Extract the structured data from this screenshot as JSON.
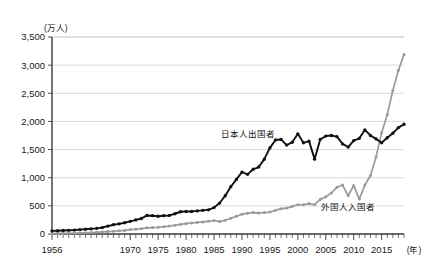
{
  "chart_data": {
    "type": "line",
    "title": "",
    "xlabel": "(年)",
    "ylabel": "(万人)",
    "ylim": [
      0,
      3500
    ],
    "xlim": [
      1956,
      2019
    ],
    "grid": true,
    "legend_position": "inline-annotation",
    "ytick_labels": [
      "0",
      "500",
      "1,000",
      "1,500",
      "2,000",
      "2,500",
      "3,000",
      "3,500"
    ],
    "ytick_values": [
      0,
      500,
      1000,
      1500,
      2000,
      2500,
      3000,
      3500
    ],
    "xtick_labels": [
      "1956",
      "1970",
      "1975",
      "1980",
      "1985",
      "1990",
      "1995",
      "2000",
      "2005",
      "2010",
      "2015"
    ],
    "xtick_values": [
      1956,
      1970,
      1975,
      1980,
      1985,
      1990,
      1995,
      2000,
      2005,
      2010,
      2015
    ],
    "x": [
      1956,
      1957,
      1958,
      1959,
      1960,
      1961,
      1962,
      1963,
      1964,
      1965,
      1966,
      1967,
      1968,
      1969,
      1970,
      1971,
      1972,
      1973,
      1974,
      1975,
      1976,
      1977,
      1978,
      1979,
      1980,
      1981,
      1982,
      1983,
      1984,
      1985,
      1986,
      1987,
      1988,
      1989,
      1990,
      1991,
      1992,
      1993,
      1994,
      1995,
      1996,
      1997,
      1998,
      1999,
      2000,
      2001,
      2002,
      2003,
      2004,
      2005,
      2006,
      2007,
      2008,
      2009,
      2010,
      2011,
      2012,
      2013,
      2014,
      2015,
      2016,
      2017,
      2018,
      2019
    ],
    "series": [
      {
        "name": "日本人出国者",
        "color": "#111111",
        "values": [
          55,
          58,
          62,
          66,
          70,
          76,
          82,
          90,
          100,
          120,
          145,
          160,
          175,
          200,
          230,
          250,
          280,
          330,
          350,
          350,
          365,
          380,
          400,
          420,
          440,
          450,
          445,
          450,
          460,
          470,
          475,
          480,
          490,
          500,
          520,
          540,
          560,
          570,
          590,
          610,
          640,
          680,
          700,
          730,
          760,
          790,
          830,
          860,
          880,
          900,
          910,
          920,
          930,
          940,
          950,
          960,
          970,
          980,
          990,
          1000,
          1010,
          1020,
          1030,
          1040
        ]
      },
      {
        "name": "外国人入国者",
        "color": "#9a9a9a",
        "values": [
          10,
          12,
          14,
          16,
          18,
          20,
          23,
          26,
          30,
          35,
          40,
          45,
          50,
          56,
          62,
          70,
          80,
          90,
          100,
          110,
          120,
          130,
          140,
          150,
          160,
          170,
          180,
          190,
          200,
          210,
          220,
          230,
          245,
          260,
          275,
          290,
          305,
          320,
          335,
          350,
          365,
          380,
          395,
          410,
          425,
          440,
          455,
          470,
          485,
          500,
          515,
          530,
          545,
          560,
          575,
          590,
          605,
          620,
          635,
          650,
          665,
          680,
          695,
          710
        ]
      }
    ],
    "series_plotted": {
      "japanese_departures": {
        "label": "日本人出国者",
        "color": "#111111",
        "points": [
          [
            1956,
            55
          ],
          [
            1957,
            58
          ],
          [
            1958,
            62
          ],
          [
            1959,
            66
          ],
          [
            1960,
            70
          ],
          [
            1961,
            78
          ],
          [
            1962,
            85
          ],
          [
            1963,
            92
          ],
          [
            1964,
            100
          ],
          [
            1965,
            115
          ],
          [
            1966,
            140
          ],
          [
            1967,
            165
          ],
          [
            1968,
            180
          ],
          [
            1969,
            200
          ],
          [
            1970,
            225
          ],
          [
            1971,
            250
          ],
          [
            1972,
            275
          ],
          [
            1973,
            330
          ],
          [
            1974,
            325
          ],
          [
            1975,
            315
          ],
          [
            1976,
            325
          ],
          [
            1977,
            330
          ],
          [
            1978,
            360
          ],
          [
            1979,
            395
          ],
          [
            1980,
            400
          ],
          [
            1981,
            400
          ],
          [
            1982,
            410
          ],
          [
            1983,
            420
          ],
          [
            1984,
            430
          ],
          [
            1985,
            470
          ],
          [
            1986,
            550
          ],
          [
            1987,
            680
          ],
          [
            1988,
            840
          ],
          [
            1989,
            970
          ],
          [
            1990,
            1100
          ],
          [
            1991,
            1060
          ],
          [
            1992,
            1150
          ],
          [
            1993,
            1190
          ],
          [
            1994,
            1330
          ],
          [
            1995,
            1530
          ],
          [
            1996,
            1670
          ],
          [
            1997,
            1680
          ],
          [
            1998,
            1580
          ],
          [
            1999,
            1630
          ],
          [
            2000,
            1780
          ],
          [
            2001,
            1620
          ],
          [
            2002,
            1650
          ],
          [
            2003,
            1330
          ],
          [
            2004,
            1680
          ],
          [
            2005,
            1740
          ],
          [
            2006,
            1750
          ],
          [
            2007,
            1730
          ],
          [
            2008,
            1600
          ],
          [
            2009,
            1545
          ],
          [
            2010,
            1660
          ],
          [
            2011,
            1700
          ],
          [
            2012,
            1850
          ],
          [
            2013,
            1750
          ],
          [
            2014,
            1690
          ],
          [
            2015,
            1620
          ],
          [
            2016,
            1710
          ],
          [
            2017,
            1790
          ],
          [
            2018,
            1890
          ],
          [
            2019,
            1950
          ]
        ]
      },
      "foreign_entrants": {
        "label": "外国人入国者",
        "color": "#9a9a9a",
        "points": [
          [
            1956,
            8
          ],
          [
            1957,
            10
          ],
          [
            1958,
            11
          ],
          [
            1959,
            13
          ],
          [
            1960,
            15
          ],
          [
            1961,
            18
          ],
          [
            1962,
            21
          ],
          [
            1963,
            25
          ],
          [
            1964,
            30
          ],
          [
            1965,
            36
          ],
          [
            1966,
            43
          ],
          [
            1967,
            49
          ],
          [
            1968,
            56
          ],
          [
            1969,
            64
          ],
          [
            1970,
            78
          ],
          [
            1971,
            85
          ],
          [
            1972,
            95
          ],
          [
            1973,
            110
          ],
          [
            1974,
            115
          ],
          [
            1975,
            120
          ],
          [
            1976,
            130
          ],
          [
            1977,
            140
          ],
          [
            1978,
            155
          ],
          [
            1979,
            170
          ],
          [
            1980,
            185
          ],
          [
            1981,
            195
          ],
          [
            1982,
            205
          ],
          [
            1983,
            215
          ],
          [
            1984,
            225
          ],
          [
            1985,
            240
          ],
          [
            1986,
            220
          ],
          [
            1987,
            245
          ],
          [
            1988,
            280
          ],
          [
            1989,
            315
          ],
          [
            1990,
            350
          ],
          [
            1991,
            370
          ],
          [
            1992,
            380
          ],
          [
            1993,
            375
          ],
          [
            1994,
            380
          ],
          [
            1995,
            390
          ],
          [
            1996,
            420
          ],
          [
            1997,
            450
          ],
          [
            1998,
            460
          ],
          [
            1999,
            490
          ],
          [
            2000,
            520
          ],
          [
            2001,
            520
          ],
          [
            2002,
            540
          ],
          [
            2003,
            520
          ],
          [
            2004,
            615
          ],
          [
            2005,
            660
          ],
          [
            2006,
            730
          ],
          [
            2007,
            830
          ],
          [
            2008,
            870
          ],
          [
            2009,
            680
          ],
          [
            2010,
            860
          ],
          [
            2011,
            620
          ],
          [
            2012,
            870
          ],
          [
            2013,
            1040
          ],
          [
            2014,
            1370
          ],
          [
            2015,
            1800
          ],
          [
            2016,
            2120
          ],
          [
            2017,
            2550
          ],
          [
            2018,
            2910
          ],
          [
            2019,
            3190
          ]
        ]
      }
    },
    "annotations": [
      {
        "text": "日本人出国者",
        "x": 1991,
        "y": 1720,
        "name": "japanese-departures-label"
      },
      {
        "text": "外国人入国者",
        "x": 2009,
        "y": 430,
        "name": "foreign-entrants-label"
      }
    ]
  }
}
